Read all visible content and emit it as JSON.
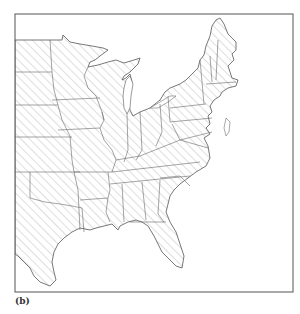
{
  "figure": {
    "caption": "(b)",
    "colors": {
      "border": "#555555",
      "state_lines": "#666666",
      "hatch": "#9a9a9a",
      "background": "#ffffff"
    }
  }
}
